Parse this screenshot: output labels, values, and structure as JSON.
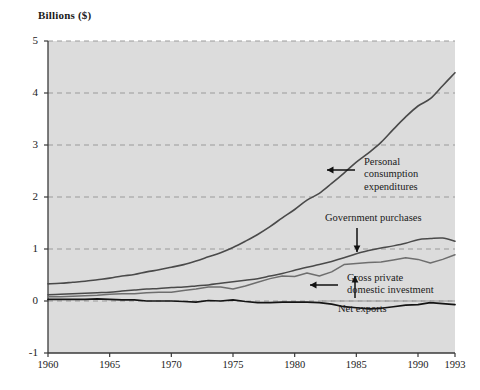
{
  "chart_data": {
    "type": "line",
    "title": "",
    "ylabel": "Billions ($)",
    "xlabel": "",
    "xlim": [
      1960,
      1993
    ],
    "ylim": [
      -1,
      5
    ],
    "grid": true,
    "grid_style": "dashed horizontal",
    "legend": "none (inline annotations with arrows)",
    "yticks": [
      "5",
      "4",
      "3",
      "2",
      "1",
      "0",
      "-1"
    ],
    "ytick_values": [
      5,
      4,
      3,
      2,
      1,
      0,
      -1
    ],
    "xticks": [
      "1960",
      "1965",
      "1970",
      "1975",
      "1980",
      "1985",
      "1990",
      "1993"
    ],
    "xtick_values": [
      1960,
      1965,
      1970,
      1975,
      1980,
      1985,
      1990,
      1993
    ],
    "x": [
      1960,
      1961,
      1962,
      1963,
      1964,
      1965,
      1966,
      1967,
      1968,
      1969,
      1970,
      1971,
      1972,
      1973,
      1974,
      1975,
      1976,
      1977,
      1978,
      1979,
      1980,
      1981,
      1982,
      1983,
      1984,
      1985,
      1986,
      1987,
      1988,
      1989,
      1990,
      1991,
      1992,
      1993
    ],
    "series": [
      {
        "name": "Personal consumption expenditures",
        "color": "#4a4a4a",
        "width": 1.6,
        "values": [
          0.33,
          0.34,
          0.36,
          0.38,
          0.41,
          0.44,
          0.48,
          0.51,
          0.56,
          0.6,
          0.65,
          0.7,
          0.77,
          0.85,
          0.93,
          1.03,
          1.15,
          1.28,
          1.43,
          1.6,
          1.76,
          1.94,
          2.07,
          2.26,
          2.46,
          2.67,
          2.85,
          3.05,
          3.3,
          3.54,
          3.75,
          3.89,
          4.14,
          4.39
        ]
      },
      {
        "name": "Government purchases",
        "color": "#4a4a4a",
        "width": 1.5,
        "values": [
          0.12,
          0.13,
          0.14,
          0.15,
          0.16,
          0.17,
          0.19,
          0.21,
          0.23,
          0.24,
          0.26,
          0.27,
          0.29,
          0.31,
          0.34,
          0.37,
          0.4,
          0.43,
          0.48,
          0.53,
          0.59,
          0.65,
          0.7,
          0.76,
          0.83,
          0.91,
          0.97,
          1.02,
          1.06,
          1.11,
          1.18,
          1.2,
          1.21,
          1.15
        ]
      },
      {
        "name": "Gross private domestic investment",
        "color": "#6e6e6e",
        "width": 1.5,
        "values": [
          0.08,
          0.08,
          0.09,
          0.1,
          0.11,
          0.13,
          0.14,
          0.14,
          0.16,
          0.17,
          0.17,
          0.2,
          0.23,
          0.27,
          0.27,
          0.23,
          0.29,
          0.36,
          0.43,
          0.48,
          0.47,
          0.54,
          0.48,
          0.56,
          0.7,
          0.72,
          0.74,
          0.75,
          0.79,
          0.83,
          0.8,
          0.73,
          0.8,
          0.89
        ]
      },
      {
        "name": "Net exports",
        "color": "#141414",
        "width": 1.7,
        "values": [
          0.03,
          0.03,
          0.03,
          0.03,
          0.04,
          0.03,
          0.02,
          0.02,
          0.0,
          0.0,
          0.0,
          -0.01,
          -0.02,
          0.01,
          0.0,
          0.02,
          -0.01,
          -0.03,
          -0.03,
          -0.02,
          -0.02,
          -0.02,
          -0.03,
          -0.06,
          -0.11,
          -0.13,
          -0.15,
          -0.14,
          -0.11,
          -0.08,
          -0.07,
          -0.03,
          -0.05,
          -0.07
        ]
      }
    ],
    "annotations": [
      {
        "id": "pce",
        "lines": [
          "Personal",
          "consumption",
          "expenditures"
        ],
        "arrow": "left",
        "target_year": 1986,
        "target_value": 2.6
      },
      {
        "id": "gov",
        "lines": [
          "Government purchases"
        ],
        "arrow": "down",
        "target_year": 1986,
        "target_value": 1.0
      },
      {
        "id": "gpdi",
        "lines": [
          "Gross private",
          "domestic investment"
        ],
        "arrow": "left",
        "target_year": 1983,
        "target_value": 0.56
      },
      {
        "id": "netexports",
        "lines": [
          "Net exports"
        ],
        "arrow": "up",
        "target_year": 1986,
        "target_value": -0.15
      }
    ],
    "colors": {
      "plot_background": "#dcdcdc",
      "grid": "#9a9a9a",
      "axis": "#3a3a3a",
      "text": "#1a1a1a",
      "page_background": "#ffffff"
    }
  }
}
